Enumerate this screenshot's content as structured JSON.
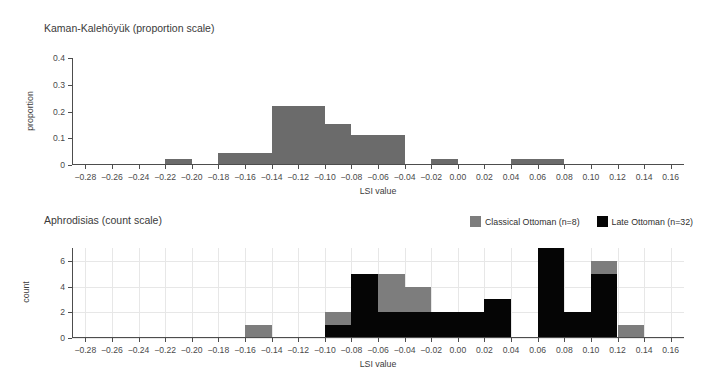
{
  "chart_data": [
    {
      "type": "bar",
      "id": "kaman-kalehoyuk",
      "title": "Kaman-Kalehöyük (proportion scale)",
      "xlabel": "LSI value",
      "ylabel": "proportion",
      "annotation": "n=45",
      "xlim": [
        -0.29,
        0.17
      ],
      "ylim": [
        0,
        0.4
      ],
      "xticks": [
        -0.28,
        -0.26,
        -0.24,
        -0.22,
        -0.2,
        -0.18,
        -0.16,
        -0.14,
        -0.12,
        -0.1,
        -0.08,
        -0.06,
        -0.04,
        -0.02,
        0.0,
        0.02,
        0.04,
        0.06,
        0.08,
        0.1,
        0.12,
        0.14,
        0.16
      ],
      "xtick_labels": [
        "-0.28",
        "-0.26",
        "-0.24",
        "-0.22",
        "-0.20",
        "-0.18",
        "-0.16",
        "-0.14",
        "-0.12",
        "-0.10",
        "-0.08",
        "-0.06",
        "-0.04",
        "-0.02",
        "0.00",
        "0.02",
        "0.04",
        "0.06",
        "0.08",
        "0.10",
        "0.12",
        "0.14",
        "0.16"
      ],
      "yticks": [
        0,
        0.1,
        0.2,
        0.3,
        0.4
      ],
      "ytick_labels": [
        "0",
        "0.1",
        "0.2",
        "0.3",
        "0.4"
      ],
      "grid": false,
      "bin_width": 0.02,
      "bars": [
        {
          "x0": -0.22,
          "x1": -0.2,
          "value": 0.022,
          "color": "#6b6b6b"
        },
        {
          "x0": -0.18,
          "x1": -0.16,
          "value": 0.044,
          "color": "#6b6b6b"
        },
        {
          "x0": -0.16,
          "x1": -0.14,
          "value": 0.044,
          "color": "#6b6b6b"
        },
        {
          "x0": -0.14,
          "x1": -0.12,
          "value": 0.222,
          "color": "#6b6b6b"
        },
        {
          "x0": -0.12,
          "x1": -0.1,
          "value": 0.222,
          "color": "#6b6b6b"
        },
        {
          "x0": -0.1,
          "x1": -0.08,
          "value": 0.155,
          "color": "#6b6b6b"
        },
        {
          "x0": -0.08,
          "x1": -0.06,
          "value": 0.111,
          "color": "#6b6b6b"
        },
        {
          "x0": -0.06,
          "x1": -0.04,
          "value": 0.111,
          "color": "#6b6b6b"
        },
        {
          "x0": -0.02,
          "x1": 0.0,
          "value": 0.022,
          "color": "#6b6b6b"
        },
        {
          "x0": 0.04,
          "x1": 0.06,
          "value": 0.022,
          "color": "#6b6b6b"
        },
        {
          "x0": 0.06,
          "x1": 0.08,
          "value": 0.022,
          "color": "#6b6b6b"
        }
      ]
    },
    {
      "type": "bar",
      "id": "aphrodisias",
      "title": "Aphrodisias (count scale)",
      "xlabel": "LSI value",
      "ylabel": "count",
      "xlim": [
        -0.29,
        0.17
      ],
      "ylim": [
        0,
        7
      ],
      "xticks": [
        -0.28,
        -0.26,
        -0.24,
        -0.22,
        -0.2,
        -0.18,
        -0.16,
        -0.14,
        -0.12,
        -0.1,
        -0.08,
        -0.06,
        -0.04,
        -0.02,
        0.0,
        0.02,
        0.04,
        0.06,
        0.08,
        0.1,
        0.12,
        0.14,
        0.16
      ],
      "xtick_labels": [
        "-0.28",
        "-0.26",
        "-0.24",
        "-0.22",
        "-0.20",
        "-0.18",
        "-0.16",
        "-0.14",
        "-0.12",
        "-0.10",
        "-0.08",
        "-0.06",
        "-0.04",
        "-0.02",
        "0.00",
        "0.02",
        "0.04",
        "0.06",
        "0.08",
        "0.10",
        "0.12",
        "0.14",
        "0.16"
      ],
      "yticks": [
        0,
        2,
        4,
        6
      ],
      "ytick_labels": [
        "0",
        "2",
        "4",
        "6"
      ],
      "grid": true,
      "bin_width": 0.02,
      "stacked": true,
      "legend": {
        "position": "top-right",
        "entries": [
          {
            "name": "Classical Ottoman (n=8)",
            "color": "#7d7d7d"
          },
          {
            "name": "Late Ottoman (n=32)",
            "color": "#050505"
          }
        ]
      },
      "bins": [
        {
          "x0": -0.16,
          "x1": -0.14,
          "late": 0,
          "classical": 1
        },
        {
          "x0": -0.1,
          "x1": -0.08,
          "late": 1,
          "classical": 1
        },
        {
          "x0": -0.08,
          "x1": -0.06,
          "late": 5,
          "classical": 0
        },
        {
          "x0": -0.06,
          "x1": -0.04,
          "late": 2,
          "classical": 3
        },
        {
          "x0": -0.04,
          "x1": -0.02,
          "late": 2,
          "classical": 2
        },
        {
          "x0": -0.02,
          "x1": 0.0,
          "late": 2,
          "classical": 0
        },
        {
          "x0": 0.0,
          "x1": 0.02,
          "late": 2,
          "classical": 0
        },
        {
          "x0": 0.02,
          "x1": 0.04,
          "late": 3,
          "classical": 0
        },
        {
          "x0": 0.06,
          "x1": 0.08,
          "late": 7,
          "classical": 0
        },
        {
          "x0": 0.08,
          "x1": 0.1,
          "late": 2,
          "classical": 0
        },
        {
          "x0": 0.1,
          "x1": 0.12,
          "late": 5,
          "classical": 1
        },
        {
          "x0": 0.12,
          "x1": 0.14,
          "late": 0,
          "classical": 1
        }
      ]
    }
  ]
}
